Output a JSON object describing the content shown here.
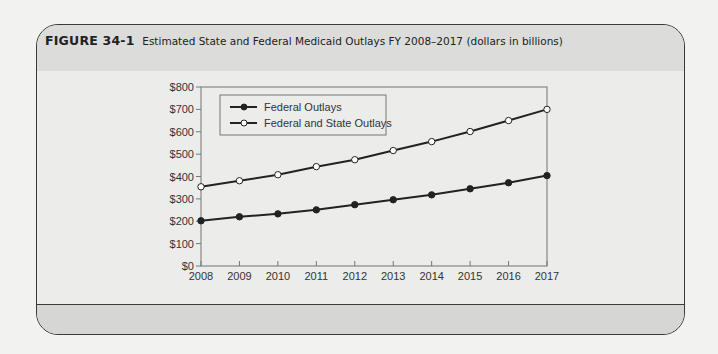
{
  "figure": {
    "label": "FIGURE 34-1",
    "title": "Estimated State and Federal Medicaid Outlays FY 2008–2017 (dollars in billions)"
  },
  "colors": {
    "frame_border": "#3a3a3a",
    "header_bg": "#dcdcda",
    "plot_bg": "#ececea",
    "footer_bg": "#d6d6d4",
    "line": "#222222"
  },
  "chart_data": {
    "type": "line",
    "title": "Estimated State and Federal Medicaid Outlays FY 2008–2017 (dollars in billions)",
    "xlabel": "",
    "ylabel": "",
    "categories": [
      "2008",
      "2009",
      "2010",
      "2011",
      "2012",
      "2013",
      "2014",
      "2015",
      "2016",
      "2017"
    ],
    "y_ticks": [
      "$0",
      "$100",
      "$200",
      "$300",
      "$400",
      "$500",
      "$600",
      "$700",
      "$800"
    ],
    "ylim": [
      0,
      800
    ],
    "grid": false,
    "legend_position": "upper-left inside",
    "series": [
      {
        "name": "Federal Outlays",
        "marker": "filled-circle",
        "values": [
          202,
          220,
          233,
          251,
          274,
          296,
          318,
          345,
          372,
          404
        ]
      },
      {
        "name": "Federal and State Outlays",
        "marker": "open-circle",
        "values": [
          354,
          381,
          408,
          444,
          475,
          516,
          556,
          601,
          650,
          700
        ]
      }
    ]
  }
}
